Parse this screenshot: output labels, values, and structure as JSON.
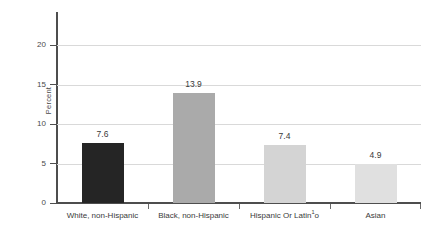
{
  "chart_data": {
    "type": "bar",
    "title": "",
    "subtitle": "",
    "xlabel": "",
    "ylabel": "Percent",
    "ylim": [
      0,
      22.5
    ],
    "yticks": [
      0,
      5,
      10,
      15,
      20
    ],
    "ytick_labels": [
      "0",
      "5",
      "10",
      "15",
      "20"
    ],
    "grid": "horizontal",
    "legend": "none",
    "categories": [
      "White, non-Hispanic",
      "Black, non-Hispanic",
      "Hispanic Or Latino",
      "Asian"
    ],
    "category_labels": [
      {
        "text": "White, non-Hispanic",
        "footnote": ""
      },
      {
        "text": "Black, non-Hispanic",
        "footnote": ""
      },
      {
        "pre": "Hispanic Or Latin",
        "footnote": "1",
        "post": "o"
      },
      {
        "text": "Asian",
        "footnote": ""
      }
    ],
    "values": [
      7.6,
      13.9,
      7.4,
      4.9
    ],
    "value_labels": [
      "7.6",
      "13.9",
      "7.4",
      "4.9"
    ],
    "bar_colors": [
      "#252525",
      "#aaaaaa",
      "#d4d4d4",
      "#e0e0e0"
    ]
  },
  "axes": {
    "y_title": "Percent",
    "ticks": [
      {
        "label": "20",
        "value": 20
      },
      {
        "label": "15",
        "value": 15
      },
      {
        "label": "10",
        "value": 10
      },
      {
        "label": "5",
        "value": 5
      },
      {
        "label": "0",
        "value": 0
      }
    ]
  },
  "colors": {
    "axis": "#4e4e4e",
    "grid": "#d9d9d9",
    "text": "#3a3a3a",
    "background": "#ffffff"
  }
}
